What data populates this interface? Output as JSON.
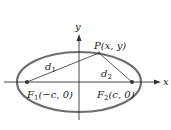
{
  "diagram": {
    "type": "ellipse-foci",
    "axes": {
      "x_label": "x",
      "y_label": "y"
    },
    "point": {
      "label": "P(x, y)"
    },
    "distances": [
      {
        "name": "d",
        "sub": "1"
      },
      {
        "name": "d",
        "sub": "2"
      }
    ],
    "foci": [
      {
        "name": "F",
        "sub": "1",
        "coords": "(−c, 0)"
      },
      {
        "name": "F",
        "sub": "2",
        "coords": "(c, 0)"
      }
    ],
    "colors": {
      "ellipse": "#6e6e6e",
      "lines": "#444444",
      "text": "#222222"
    }
  }
}
